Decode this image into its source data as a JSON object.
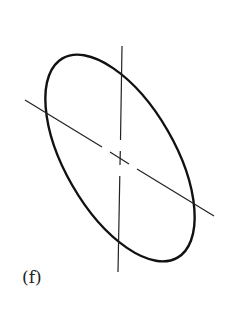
{
  "figure": {
    "label": "(f)",
    "stroke_color": "#111111",
    "background": "#ffffff",
    "ellipse": {
      "cx": 120,
      "cy": 158,
      "rx": 115,
      "ry": 55,
      "rotation_deg": 60
    },
    "vertical_axis": {
      "x1": 122,
      "y1": 46,
      "x2": 118,
      "y2": 272
    },
    "diagonal_axis": {
      "x1": 25,
      "y1": 100,
      "x2": 214,
      "y2": 216
    }
  }
}
